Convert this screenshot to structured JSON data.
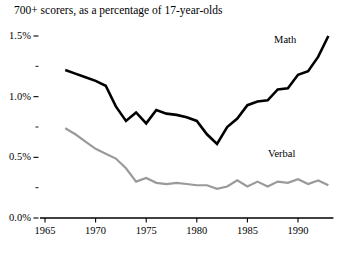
{
  "chart_data": {
    "type": "line",
    "title": "700+ scorers, as a percentage of 17-year-olds",
    "xlabel": "",
    "ylabel": "",
    "xlim": [
      1964.5,
      1993.5
    ],
    "ylim": [
      0.0,
      1.6
    ],
    "grid": false,
    "legend_position": "inline-end-of-line",
    "x_ticks": [
      1965,
      1970,
      1975,
      1980,
      1985,
      1990
    ],
    "x_tick_labels": [
      "1965",
      "1970",
      "1975",
      "1980",
      "1985",
      "1990"
    ],
    "y_ticks": [
      0.0,
      0.5,
      1.0,
      1.5
    ],
    "y_tick_labels": [
      "0.0%",
      "0.5%",
      "1.0%",
      "1.5%"
    ],
    "y_minor_ticks": [
      0.25,
      0.75,
      1.25
    ],
    "x": [
      1967,
      1968,
      1969,
      1970,
      1971,
      1972,
      1973,
      1974,
      1975,
      1976,
      1977,
      1978,
      1979,
      1980,
      1981,
      1982,
      1983,
      1984,
      1985,
      1986,
      1987,
      1988,
      1989,
      1990,
      1991,
      1992,
      1993
    ],
    "series": [
      {
        "name": "Math",
        "color": "#000000",
        "values": [
          1.22,
          1.19,
          1.16,
          1.13,
          1.09,
          0.92,
          0.8,
          0.87,
          0.78,
          0.89,
          0.86,
          0.85,
          0.83,
          0.8,
          0.69,
          0.61,
          0.75,
          0.82,
          0.93,
          0.96,
          0.97,
          1.06,
          1.07,
          1.18,
          1.21,
          1.33,
          1.5
        ]
      },
      {
        "name": "Verbal",
        "color": "#9a9a9a",
        "values": [
          0.74,
          0.69,
          0.63,
          0.57,
          0.53,
          0.49,
          0.41,
          0.3,
          0.33,
          0.29,
          0.28,
          0.29,
          0.28,
          0.27,
          0.27,
          0.24,
          0.26,
          0.31,
          0.26,
          0.3,
          0.26,
          0.3,
          0.29,
          0.32,
          0.28,
          0.31,
          0.27
        ]
      }
    ],
    "annotations": [
      {
        "name": "math-series-label",
        "text": "Math",
        "x": 1990.6,
        "y": 1.47
      },
      {
        "name": "verbal-series-label",
        "text": "Verbal",
        "x": 1990.0,
        "y": 0.53
      }
    ]
  }
}
